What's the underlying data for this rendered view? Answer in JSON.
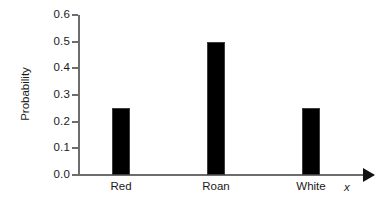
{
  "chart_data": {
    "type": "bar",
    "title": "",
    "xlabel": "x",
    "ylabel": "Probability",
    "categories": [
      "Red",
      "Roan",
      "White"
    ],
    "values": [
      0.25,
      0.5,
      0.25
    ],
    "ylim": [
      0.0,
      0.6
    ],
    "ytick_labels": [
      "0.0",
      "0.1",
      "0.2",
      "0.3",
      "0.4",
      "0.5",
      "0.6"
    ],
    "ytick_values": [
      0.0,
      0.1,
      0.2,
      0.3,
      0.4,
      0.5,
      0.6
    ],
    "grid": false,
    "legend": false,
    "bar_color": "#000000",
    "axis_color": "#6d6d6d",
    "text_color": "#1a1a1a",
    "background": "#ffffff",
    "x_axis_arrow": true
  }
}
